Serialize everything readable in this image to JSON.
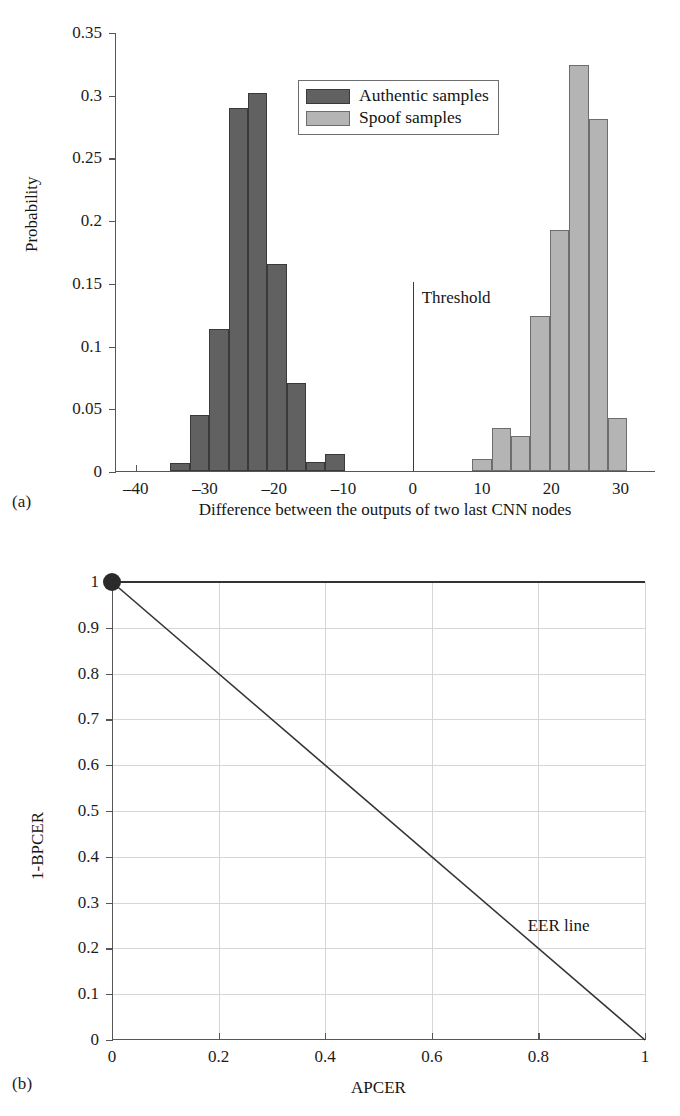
{
  "figure": {
    "panel_a_tag": "(a)",
    "panel_b_tag": "(b)"
  },
  "chart_data": [
    {
      "id": "panel-a",
      "type": "bar",
      "title": "",
      "xlabel": "Difference between the outputs of two last CNN nodes",
      "ylabel": "Probability",
      "xlim": [
        -43,
        35
      ],
      "ylim": [
        0,
        0.35
      ],
      "xticks": [
        -40,
        -30,
        -20,
        -10,
        0,
        10,
        20,
        30
      ],
      "xtick_labels": [
        "–40",
        "–30",
        "–20",
        "–10",
        "0",
        "10",
        "20",
        "30"
      ],
      "yticks": [
        0,
        0.05,
        0.1,
        0.15,
        0.2,
        0.25,
        0.3,
        0.35
      ],
      "ytick_labels": [
        "0",
        "0.05",
        "0.1",
        "0.15",
        "0.2",
        "0.25",
        "0.3",
        "0.35"
      ],
      "grid": false,
      "legend_position": "upper-center",
      "bin_width": 2.8,
      "series": [
        {
          "name": "Authentic samples",
          "color": "#616161",
          "bin_starts": [
            -35.0,
            -32.2,
            -29.4,
            -26.6,
            -23.8,
            -21.0,
            -18.2,
            -15.4,
            -12.6
          ],
          "values": [
            0.006,
            0.044,
            0.113,
            0.289,
            0.301,
            0.165,
            0.07,
            0.007,
            0.013
          ],
          "bar_order_note": "left to right from -35"
        },
        {
          "name": "Spoof samples",
          "color": "#b4b4b4",
          "bin_starts": [
            8.6,
            11.4,
            14.2,
            17.0,
            19.8,
            22.6,
            25.4,
            28.2
          ],
          "values": [
            0.009,
            0.034,
            0.028,
            0.123,
            0.192,
            0.323,
            0.28,
            0.042
          ],
          "bar_order_note": "left to right from 8.6"
        }
      ],
      "annotations": [
        {
          "text": "Threshold",
          "x": 0,
          "y": 0.15,
          "kind": "vertical-line-with-label"
        }
      ],
      "legend": [
        {
          "label": "Authentic samples",
          "color": "#616161"
        },
        {
          "label": "Spoof samples",
          "color": "#b4b4b4"
        }
      ]
    },
    {
      "id": "panel-b",
      "type": "line",
      "title": "",
      "xlabel": "APCER",
      "ylabel": "1-BPCER",
      "xlim": [
        0,
        1
      ],
      "ylim": [
        0,
        1
      ],
      "xticks": [
        0,
        0.2,
        0.4,
        0.6,
        0.8,
        1
      ],
      "xtick_labels": [
        "0",
        "0.2",
        "0.4",
        "0.6",
        "0.8",
        "1"
      ],
      "yticks": [
        0,
        0.1,
        0.2,
        0.3,
        0.4,
        0.5,
        0.6,
        0.7,
        0.8,
        0.9,
        1
      ],
      "ytick_labels": [
        "0",
        "0.1",
        "0.2",
        "0.3",
        "0.4",
        "0.5",
        "0.6",
        "0.7",
        "0.8",
        "0.9",
        "1"
      ],
      "grid": true,
      "legend_position": "none",
      "series": [
        {
          "name": "ROC curve",
          "color": "#333333",
          "x": [
            0,
            1
          ],
          "y": [
            1,
            1
          ],
          "marker_points": [
            {
              "x": 0,
              "y": 1
            }
          ]
        },
        {
          "name": "EER line",
          "color": "#333333",
          "x": [
            0,
            1
          ],
          "y": [
            1,
            0
          ]
        }
      ],
      "annotations": [
        {
          "text": "EER line",
          "x": 0.78,
          "y": 0.25,
          "kind": "text"
        }
      ]
    }
  ]
}
